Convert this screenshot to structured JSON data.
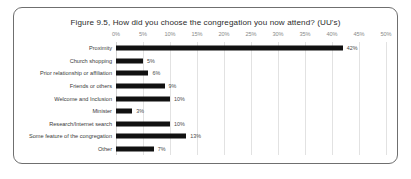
{
  "chart_data": {
    "type": "bar",
    "orientation": "horizontal",
    "title": "Figure 9.5, How did you choose the congregation you now attend? (UU's)",
    "xlabel": "",
    "ylabel": "",
    "xlim": [
      0,
      50
    ],
    "grid": true,
    "legend": null,
    "tick_labels": [
      "0%",
      "5%",
      "10%",
      "15%",
      "20%",
      "25%",
      "30%",
      "35%",
      "40%",
      "45%",
      "50%"
    ],
    "tick_values": [
      0,
      5,
      10,
      15,
      20,
      25,
      30,
      35,
      40,
      45,
      50
    ],
    "categories": [
      "Proximity",
      "Church shopping",
      "Prior relationship or affiliation",
      "Friends or others",
      "Welcome and Inclusion",
      "Minister",
      "Research/Internet search",
      "Some feature of the congregation",
      "Other"
    ],
    "values": [
      42,
      5,
      6,
      9,
      10,
      3,
      10,
      13,
      7
    ],
    "value_labels": [
      "42%",
      "5%",
      "6%",
      "9%",
      "10%",
      "3%",
      "10%",
      "13%",
      "7%"
    ],
    "bar_color": "#111111",
    "grid_color": "#e2e2e2"
  }
}
